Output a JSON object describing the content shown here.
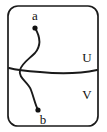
{
  "figure": {
    "type": "topological-curve-diagram",
    "background_color": "#ffffff",
    "ink_color": "#1a1a1a",
    "frame": {
      "name": "rounded-rectangle-boundary",
      "x": 8,
      "y": 6,
      "width": 90,
      "height": 120,
      "corner_radius": 10,
      "stroke_width": 1.7
    },
    "labels": [
      {
        "id": "a",
        "text": "a",
        "x": 35,
        "y": 20
      },
      {
        "id": "b",
        "text": "b",
        "x": 43,
        "y": 124
      },
      {
        "id": "U",
        "text": "U",
        "x": 87,
        "y": 62
      },
      {
        "id": "V",
        "text": "V",
        "x": 87,
        "y": 99
      }
    ],
    "points": [
      {
        "id": "a-endpoint",
        "label": "a",
        "x": 35,
        "y": 28,
        "radius": 2.6
      },
      {
        "id": "b-endpoint",
        "label": "b",
        "x": 38,
        "y": 110,
        "radius": 2.6
      }
    ],
    "curves": [
      {
        "id": "arc-a-to-b",
        "name": "vertical-s-curve",
        "from": "a",
        "to": "b",
        "path": "M 35 28 C 41 38 41 46 35 53 C 28 60 22 63 20 70 C 18 78 28 82 31 90 C 34 98 35 104 38 110"
      },
      {
        "id": "arc-horizontal",
        "name": "horizontal-separating-curve",
        "from": "left-border",
        "to": "right-border",
        "path": "M 9 68 C 16 70 24 71 40 72 C 60 74 78 74 97 70"
      }
    ],
    "regions": [
      {
        "id": "U",
        "label": "U",
        "position": "above-horizontal-curve"
      },
      {
        "id": "V",
        "label": "V",
        "position": "below-horizontal-curve"
      }
    ]
  }
}
